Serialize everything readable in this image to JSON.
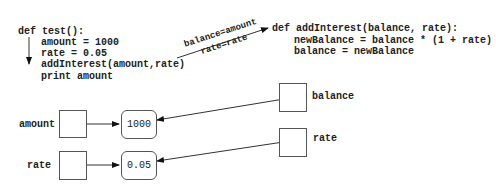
{
  "caller": {
    "def_line": "def test():",
    "body": [
      "amount = 1000",
      "rate = 0.05",
      "addInterest(amount,rate)",
      "print amount"
    ]
  },
  "callee": {
    "def_line": "def addInterest(balance, rate):",
    "body": [
      "newBalance = balance * (1 + rate)",
      "balance = newBalance"
    ]
  },
  "parameter_passing": {
    "top": "balance=amount",
    "bottom": "rate=rate"
  },
  "caller_vars": [
    {
      "name": "amount",
      "value": "1000"
    },
    {
      "name": "rate",
      "value": "0.05"
    }
  ],
  "callee_vars": [
    {
      "name": "balance"
    },
    {
      "name": "rate"
    }
  ]
}
